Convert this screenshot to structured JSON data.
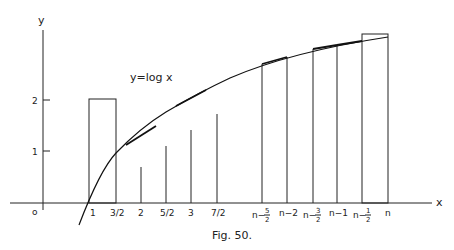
{
  "figure": {
    "caption": "Fig. 50.",
    "equation_label": "y=log x",
    "axis_labels": {
      "x": "x",
      "y": "y",
      "origin": "o"
    },
    "y_ticks": [
      {
        "value": 1,
        "label": "1"
      },
      {
        "value": 2,
        "label": "2"
      }
    ],
    "x_ticks_left": [
      {
        "value": 1,
        "label": "1"
      },
      {
        "value": 1.5,
        "label": "3/2"
      },
      {
        "value": 2,
        "label": "2"
      },
      {
        "value": 2.5,
        "label": "5/2"
      },
      {
        "value": 3,
        "label": "3"
      },
      {
        "value": 3.5,
        "label": "7/2"
      }
    ],
    "x_ticks_right": [
      {
        "offset": -2.5,
        "label": "n−",
        "num": "5",
        "den": "2",
        "fraction": true
      },
      {
        "offset": -2,
        "label": "n−2",
        "fraction": false
      },
      {
        "offset": -1.5,
        "label": "n−",
        "num": "3",
        "den": "2",
        "fraction": true
      },
      {
        "offset": -1,
        "label": "n−1",
        "fraction": false
      },
      {
        "offset": -0.5,
        "label": "n−",
        "num": "1",
        "den": "2",
        "fraction": true
      },
      {
        "offset": 0,
        "label": "n",
        "fraction": false
      }
    ],
    "rectangles": [
      {
        "name": "left-block",
        "from": "1",
        "to": "3/2"
      },
      {
        "name": "right-block",
        "from": "n-1/2",
        "to": "n"
      }
    ]
  }
}
